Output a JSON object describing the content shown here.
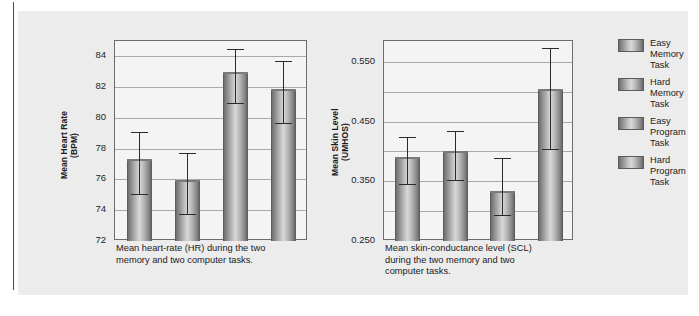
{
  "figure": {
    "background_color": "#ececec",
    "page_rule_color": "#4a4a4a"
  },
  "legend": {
    "position": "right",
    "items": [
      {
        "label": "Easy\nMemory\nTask",
        "swatch_name": "legend-swatch-easy-memory"
      },
      {
        "label": "Hard\nMemory\nTask",
        "swatch_name": "legend-swatch-hard-memory"
      },
      {
        "label": "Easy\nProgram\nTask",
        "swatch_name": "legend-swatch-easy-program"
      },
      {
        "label": "Hard\nProgram\nTask",
        "swatch_name": "legend-swatch-hard-program"
      }
    ]
  },
  "chart_data": [
    {
      "id": "hr",
      "type": "bar",
      "title": "",
      "caption": "Mean heart-rate (HR) during the two\nmemory and two computer tasks.",
      "xlabel": "",
      "ylabel": "Mean Heart Rate\n(BPM)",
      "ylim": [
        72,
        85
      ],
      "yticks": [
        72,
        74,
        76,
        78,
        80,
        82,
        84
      ],
      "ytick_labels": [
        "72",
        "74",
        "76",
        "78",
        "80",
        "82",
        "84"
      ],
      "grid": true,
      "categories": [
        "Easy Memory Task",
        "Hard Memory Task",
        "Easy Program Task",
        "Hard Program Task"
      ],
      "values": [
        77.3,
        75.95,
        83.0,
        81.9
      ],
      "errors_low": [
        75.0,
        73.7,
        80.9,
        79.6
      ],
      "errors_high": [
        79.1,
        77.7,
        84.5,
        83.7
      ],
      "units": "BPM"
    },
    {
      "id": "scl",
      "type": "bar",
      "title": "",
      "caption": "Mean skin-conductance level (SCL)\nduring the two memory and two\ncomputer tasks.",
      "xlabel": "",
      "ylabel": "Mean Skin Level\n(UMHOS)",
      "ylim": [
        0.25,
        0.585
      ],
      "yticks": [
        0.25,
        0.35,
        0.45,
        0.55
      ],
      "ytick_labels": [
        "0.250",
        "0.350",
        "0.450",
        "0.550"
      ],
      "grid": true,
      "categories": [
        "Easy Memory Task",
        "Hard Memory Task",
        "Easy Program Task",
        "Hard Program Task"
      ],
      "values": [
        0.391,
        0.401,
        0.334,
        0.505
      ],
      "errors_low": [
        0.343,
        0.351,
        0.292,
        0.403
      ],
      "errors_high": [
        0.424,
        0.434,
        0.389,
        0.573
      ],
      "units": "UMHOS"
    }
  ]
}
